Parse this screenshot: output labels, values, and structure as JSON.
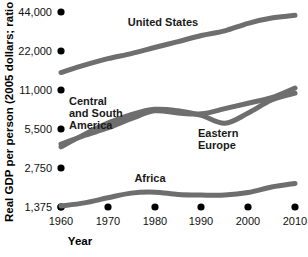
{
  "chart_data": {
    "type": "line",
    "title": "",
    "xlabel": "Year",
    "ylabel": "Real GDP per person (2005 dollars; ratio scale)",
    "scale": "ratio (logarithmic, base-2 doubling)",
    "grid": false,
    "legend": "inline data labels",
    "x": [
      1960,
      1965,
      1970,
      1975,
      1980,
      1985,
      1990,
      1995,
      2000,
      2005,
      2010
    ],
    "xticks": [
      "1960",
      "1970",
      "1980",
      "1990",
      "2000",
      "2010"
    ],
    "xlim": [
      1960,
      2010
    ],
    "yticks": [
      "1,375",
      "2,750",
      "5,500",
      "11,000",
      "22,000",
      "44,000"
    ],
    "ytickvalues": [
      1375,
      2750,
      5500,
      11000,
      22000,
      44000
    ],
    "ylim": [
      1375,
      44000
    ],
    "series": [
      {
        "name": "United States",
        "color": "#6e6e6e",
        "values": [
          15000,
          17100,
          19200,
          21000,
          23400,
          26000,
          29000,
          31500,
          36000,
          39500,
          41500
        ]
      },
      {
        "name": "Central and South America",
        "color": "#6e6e6e",
        "values": [
          4200,
          4900,
          5600,
          6600,
          7600,
          7300,
          7200,
          7900,
          8700,
          9600,
          11400
        ]
      },
      {
        "name": "Eastern Europe",
        "color": "#6e6e6e",
        "values": [
          4000,
          5000,
          6100,
          7100,
          7800,
          7600,
          7000,
          6100,
          7300,
          9200,
          10400
        ]
      },
      {
        "name": "Africa",
        "color": "#6e6e6e",
        "values": [
          1400,
          1480,
          1620,
          1760,
          1790,
          1720,
          1700,
          1700,
          1780,
          1960,
          2090
        ]
      }
    ]
  },
  "labels": {
    "united_states": "United States",
    "central_south_america_line1": "Central",
    "central_south_america_line2": "and South",
    "central_south_america_line3": "America",
    "eastern_europe_line1": "Eastern",
    "eastern_europe_line2": "Europe",
    "africa": "Africa"
  },
  "axes": {
    "y_title": "Real GDP per person (2005 dollars; ratio scale)",
    "x_title": "Year",
    "y_ticks": [
      "44,000",
      "22,000",
      "11,000",
      "5,500",
      "2,750",
      "1,375"
    ],
    "x_ticks": [
      "1960",
      "1970",
      "1980",
      "1990",
      "2000",
      "2010"
    ]
  }
}
